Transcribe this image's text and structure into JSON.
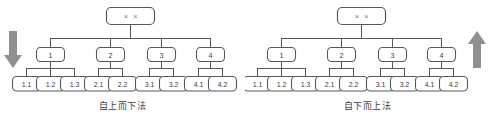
{
  "figures": [
    {
      "id": "top-down",
      "caption": "自上而下法",
      "arrow": {
        "name": "down-arrow-icon",
        "direction": "down",
        "side": "left"
      },
      "root": {
        "label": "× ×"
      },
      "level1": [
        {
          "label": "1"
        },
        {
          "label": "2"
        },
        {
          "label": "3"
        },
        {
          "label": "4"
        }
      ],
      "leaves": [
        {
          "label": "1.1"
        },
        {
          "label": "1.2"
        },
        {
          "label": "1.3"
        },
        {
          "label": "2.1"
        },
        {
          "label": "2.2"
        },
        {
          "label": "3.1"
        },
        {
          "label": "3.2"
        },
        {
          "label": "4.1"
        },
        {
          "label": "4.2"
        }
      ]
    },
    {
      "id": "bottom-up",
      "caption": "自下而上法",
      "arrow": {
        "name": "up-arrow-icon",
        "direction": "up",
        "side": "right"
      },
      "root": {
        "label": "× ×"
      },
      "level1": [
        {
          "label": "1"
        },
        {
          "label": "2"
        },
        {
          "label": "3"
        },
        {
          "label": "4"
        }
      ],
      "leaves": [
        {
          "label": "1.1"
        },
        {
          "label": "1.2"
        },
        {
          "label": "1.3"
        },
        {
          "label": "2.1"
        },
        {
          "label": "2.2"
        },
        {
          "label": "3.1"
        },
        {
          "label": "3.2"
        },
        {
          "label": "4.1"
        },
        {
          "label": "4.2"
        }
      ]
    }
  ],
  "colors": {
    "stroke": "#55595c",
    "node_text": "#3d3d3d",
    "root_text": "#7d7d7d",
    "arrow": "#8f8f8f",
    "background": "#ffffff"
  }
}
